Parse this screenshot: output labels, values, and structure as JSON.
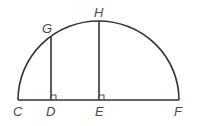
{
  "diagram": {
    "type": "semicircle-geometry",
    "stroke_color": "#333333",
    "label_color": "#4a4a4a",
    "points": {
      "C": {
        "label": "C",
        "x": 18,
        "y": 100
      },
      "D": {
        "label": "D",
        "x": 51,
        "y": 100
      },
      "E": {
        "label": "E",
        "x": 99,
        "y": 100
      },
      "F": {
        "label": "F",
        "x": 179,
        "y": 100
      },
      "G": {
        "label": "G",
        "x": 51,
        "y": 36
      },
      "H": {
        "label": "H",
        "x": 99,
        "y": 21
      }
    },
    "segments": [
      {
        "from": "C",
        "to": "F",
        "name": "diameter-CF"
      },
      {
        "from": "G",
        "to": "D",
        "name": "segment-GD"
      },
      {
        "from": "H",
        "to": "E",
        "name": "segment-HE"
      }
    ],
    "arc": {
      "from": "C",
      "to": "F",
      "center": "E",
      "radius": 80
    },
    "right_angles": [
      "D",
      "E"
    ]
  }
}
